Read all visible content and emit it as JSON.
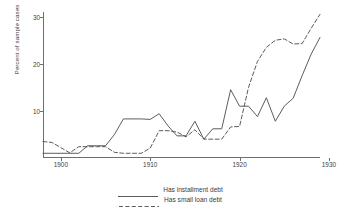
{
  "chart_data": {
    "type": "line",
    "title": "",
    "xlabel": "",
    "ylabel": "Percent of sample cases",
    "xlim": [
      1898,
      1929
    ],
    "ylim": [
      0,
      31
    ],
    "xticks": [
      1900,
      1910,
      1920,
      1930
    ],
    "yticks": [
      10,
      20,
      30
    ],
    "grid": false,
    "legend_position": "below",
    "x": [
      1898,
      1899,
      1900,
      1901,
      1902,
      1903,
      1904,
      1905,
      1906,
      1907,
      1908,
      1909,
      1910,
      1911,
      1912,
      1913,
      1914,
      1915,
      1916,
      1917,
      1918,
      1919,
      1920,
      1921,
      1922,
      1923,
      1924,
      1925,
      1926,
      1927,
      1928,
      1929
    ],
    "series": [
      {
        "name": "Has installment debt",
        "style": "solid",
        "color": "#4a4a4a",
        "values": [
          1.0,
          1.0,
          1.0,
          1.0,
          1.0,
          2.6,
          2.6,
          2.6,
          5.0,
          8.3,
          8.3,
          8.3,
          8.2,
          9.4,
          6.8,
          4.7,
          4.7,
          7.8,
          4.0,
          6.2,
          6.2,
          14.5,
          11.0,
          11.0,
          8.8,
          12.8,
          7.8,
          11.0,
          12.7,
          17.5,
          22.0,
          25.6
        ]
      },
      {
        "name": "Has small loan debt",
        "style": "dashed",
        "color": "#4a4a4a",
        "values": [
          3.5,
          3.3,
          2.2,
          1.1,
          2.4,
          2.4,
          2.4,
          2.4,
          1.2,
          1.0,
          1.0,
          1.0,
          2.1,
          5.8,
          5.8,
          5.5,
          4.5,
          6.0,
          4.0,
          4.0,
          4.0,
          6.6,
          6.7,
          15.0,
          20.5,
          23.5,
          25.0,
          25.3,
          24.2,
          24.3,
          27.5,
          30.5
        ]
      }
    ]
  },
  "legend": {
    "items": [
      {
        "label": "Has installment debt",
        "style": "solid"
      },
      {
        "label": "Has small loan debt",
        "style": "dashed"
      }
    ]
  }
}
